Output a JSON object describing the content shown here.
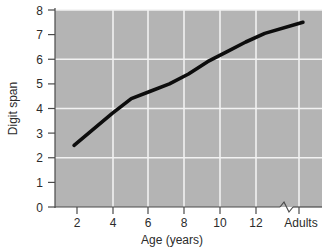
{
  "chart_data": {
    "type": "line",
    "title": "",
    "xlabel": "Age (years)",
    "ylabel": "Digit span",
    "x": [
      2,
      3,
      4,
      5,
      6,
      7,
      8,
      9,
      10,
      11,
      12,
      14
    ],
    "values": [
      2.5,
      3.15,
      3.8,
      4.4,
      4.7,
      5.0,
      5.4,
      5.9,
      6.3,
      6.7,
      7.05,
      7.5
    ],
    "series": [
      {
        "name": "Digit span",
        "points": [
          {
            "x": 2,
            "y": 2.5
          },
          {
            "x": 3,
            "y": 3.15
          },
          {
            "x": 4,
            "y": 3.8
          },
          {
            "x": 5,
            "y": 4.4
          },
          {
            "x": 6,
            "y": 4.7
          },
          {
            "x": 7,
            "y": 5.0
          },
          {
            "x": 8,
            "y": 5.4
          },
          {
            "x": 9,
            "y": 5.9
          },
          {
            "x": 10,
            "y": 6.3
          },
          {
            "x": 11,
            "y": 6.7
          },
          {
            "x": 12,
            "y": 7.05
          },
          {
            "x": 14,
            "y": 7.5
          }
        ],
        "color": "#0d0d0d"
      }
    ],
    "xlim": [
      1,
      15
    ],
    "ylim": [
      0,
      8
    ],
    "x_tick_values": [
      2,
      4,
      6,
      8,
      10,
      12,
      14
    ],
    "x_tick_labels": [
      "2",
      "4",
      "6",
      "8",
      "10",
      "12",
      "Adults"
    ],
    "y_tick_values": [
      0,
      1,
      2,
      3,
      4,
      5,
      6,
      7,
      8
    ],
    "y_tick_labels": [
      "0",
      "1",
      "2",
      "3",
      "4",
      "5",
      "6",
      "7",
      "8"
    ],
    "x_gridlines": [
      4,
      6,
      8,
      10,
      12,
      14
    ],
    "y_gridlines": [
      2,
      4,
      6,
      8
    ],
    "grid": true,
    "legend": "none",
    "axis_break": {
      "axis": "x",
      "between": [
        12,
        14
      ],
      "style": "zigzag"
    },
    "plot_background_color": "#b4b4b4",
    "gridline_color": "#f2f2f2"
  },
  "axes": {
    "y_title": "Digit span",
    "x_title": "Age (years)",
    "y_labels": [
      "8",
      "7",
      "6",
      "5",
      "4",
      "3",
      "2",
      "1",
      "0"
    ],
    "x_labels": [
      "2",
      "4",
      "6",
      "8",
      "10",
      "12",
      "Adults"
    ]
  }
}
